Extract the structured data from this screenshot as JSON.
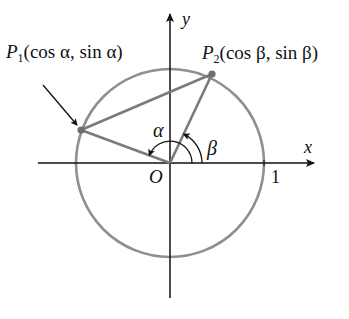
{
  "diagram": {
    "type": "unit-circle",
    "axes": {
      "x_label": "x",
      "y_label": "y"
    },
    "origin_label": "O",
    "tick_label": "1",
    "points": [
      {
        "name": "P",
        "sub": "1",
        "coords": "(cos α, sin α)",
        "angle_label": "α"
      },
      {
        "name": "P",
        "sub": "2",
        "coords": "(cos β, sin β)",
        "angle_label": "β"
      }
    ],
    "colors": {
      "circle": "#8a8a8a",
      "axes": "#111111",
      "segments": "#7a7a7a"
    }
  }
}
